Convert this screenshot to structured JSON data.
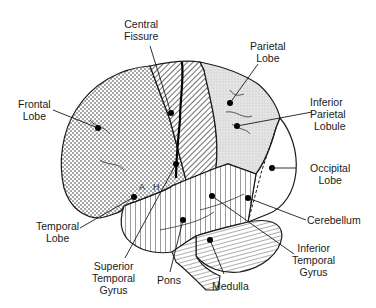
{
  "diagram": {
    "labels": {
      "central_fissure": [
        "Central",
        "Fissure"
      ],
      "parietal_lobe": [
        "Parietal",
        "Lobe"
      ],
      "frontal_lobe": [
        "Frontal",
        "Lobe"
      ],
      "inferior_parietal_lobule": [
        "Inferior",
        "Parietal",
        "Lobule"
      ],
      "occipital_lobe": [
        "Occipital",
        "Lobe"
      ],
      "cerebellum": [
        "Cerebellum"
      ],
      "temporal_lobe": [
        "Temporal",
        "Lobe"
      ],
      "inferior_temporal_gyrus": [
        "Inferior",
        "Temporal",
        "Gyrus"
      ],
      "superior_temporal_gyrus": [
        "Superior",
        "Temporal",
        "Gyrus"
      ],
      "pons": [
        "Pons"
      ],
      "medulla": [
        "Medulla"
      ]
    },
    "region_letters": {
      "a": "A",
      "h": "H"
    },
    "colors": {
      "ink": "#1a1a1a",
      "background": "#ffffff",
      "light_fill": "#e6e6e6",
      "occipital_fill": "#ffffff"
    }
  }
}
